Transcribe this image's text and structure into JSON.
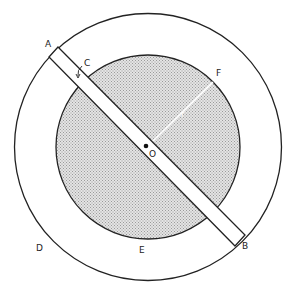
{
  "diagram": {
    "labels": {
      "A": "A",
      "B": "B",
      "C": "C",
      "D": "D",
      "E": "E",
      "F": "F",
      "O": "O",
      "r": "r"
    },
    "colors": {
      "stroke": "#222222",
      "fill_inner": "#cfcfcf",
      "background": "#ffffff"
    }
  }
}
